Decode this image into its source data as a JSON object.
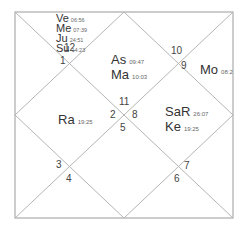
{
  "chart": {
    "style": "north-indian",
    "line_color": "#b5b5b5",
    "frame_color": "#9a9a9a"
  },
  "houses": [
    {
      "num": "1"
    },
    {
      "num": "2"
    },
    {
      "num": "3"
    },
    {
      "num": "4"
    },
    {
      "num": "5"
    },
    {
      "num": "6"
    },
    {
      "num": "7"
    },
    {
      "num": "8"
    },
    {
      "num": "9"
    },
    {
      "num": "10"
    },
    {
      "num": "11"
    },
    {
      "num": "12"
    }
  ],
  "planets": {
    "ve": {
      "name": "Ve",
      "deg": "06:56"
    },
    "me": {
      "name": "Me",
      "deg": "07:39"
    },
    "ju": {
      "name": "Ju",
      "deg": "24:51"
    },
    "su": {
      "name": "Su",
      "deg": "14:23"
    },
    "as": {
      "name": "As",
      "deg": "09:47"
    },
    "ma": {
      "name": "Ma",
      "deg": "10:03"
    },
    "mo": {
      "name": "Mo",
      "deg": "08:2"
    },
    "ra": {
      "name": "Ra",
      "deg": "19:25"
    },
    "sa": {
      "name": "SaR",
      "deg": "26:07"
    },
    "ke": {
      "name": "Ke",
      "deg": "19:25"
    }
  }
}
